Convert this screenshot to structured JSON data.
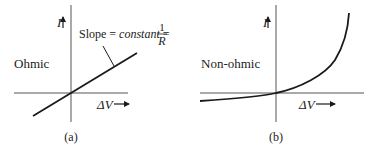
{
  "panels": [
    {
      "id": "a",
      "caption": "(a)",
      "label": "Ohmic",
      "y_axis_label": "I",
      "x_axis_label": "ΔV",
      "annotation": {
        "prefix": "Slope = ",
        "italic": "constant",
        "middle": " = ",
        "fraction_numerator": "1",
        "fraction_denominator": "R"
      }
    },
    {
      "id": "b",
      "caption": "(b)",
      "label": "Non-ohmic",
      "y_axis_label": "I",
      "x_axis_label": "ΔV"
    }
  ],
  "colors": {
    "curve": "#1a1a1a",
    "axis": "#555555",
    "text": "#222222"
  }
}
